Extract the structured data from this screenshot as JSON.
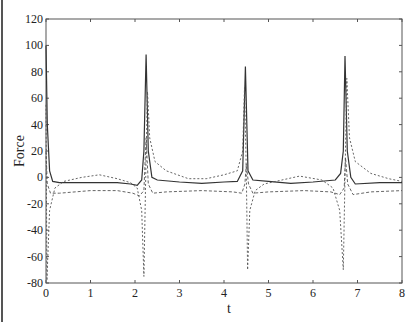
{
  "chart_data": {
    "type": "line",
    "title": "",
    "xlabel": "t",
    "ylabel": "Force",
    "xlim": [
      0,
      8
    ],
    "ylim": [
      -80,
      120
    ],
    "xticks": [
      0,
      1,
      2,
      3,
      4,
      5,
      6,
      7,
      8
    ],
    "yticks": [
      -80,
      -60,
      -40,
      -20,
      0,
      20,
      40,
      60,
      80,
      100,
      120
    ],
    "grid": false,
    "legend": null,
    "series": [
      {
        "name": "solid",
        "style": "solid",
        "points": [
          [
            0,
            100
          ],
          [
            0.03,
            40
          ],
          [
            0.08,
            5
          ],
          [
            0.15,
            -3
          ],
          [
            0.3,
            -4
          ],
          [
            1.0,
            -4
          ],
          [
            1.6,
            -4
          ],
          [
            1.9,
            -5
          ],
          [
            2.05,
            -6
          ],
          [
            2.15,
            -2
          ],
          [
            2.2,
            20
          ],
          [
            2.25,
            93
          ],
          [
            2.3,
            20
          ],
          [
            2.38,
            0
          ],
          [
            2.5,
            -2
          ],
          [
            3.0,
            -3.5
          ],
          [
            3.5,
            -4.5
          ],
          [
            4.0,
            -3.5
          ],
          [
            4.3,
            -3
          ],
          [
            4.42,
            5
          ],
          [
            4.48,
            84
          ],
          [
            4.54,
            5
          ],
          [
            4.65,
            -2
          ],
          [
            5.0,
            -3
          ],
          [
            5.5,
            -4.5
          ],
          [
            6.0,
            -3.5
          ],
          [
            6.5,
            -2
          ],
          [
            6.62,
            3
          ],
          [
            6.68,
            20
          ],
          [
            6.72,
            92
          ],
          [
            6.77,
            20
          ],
          [
            6.85,
            0
          ],
          [
            6.95,
            -5
          ],
          [
            7.5,
            -4
          ],
          [
            8.0,
            -4
          ]
        ]
      },
      {
        "name": "dash-dot",
        "style": "dashdot",
        "points": [
          [
            0,
            55
          ],
          [
            0.02,
            -78
          ],
          [
            0.08,
            -25
          ],
          [
            0.2,
            -8
          ],
          [
            0.4,
            -3
          ],
          [
            0.8,
            0
          ],
          [
            1.2,
            2
          ],
          [
            1.6,
            -1
          ],
          [
            1.9,
            -4
          ],
          [
            2.05,
            -8
          ],
          [
            2.15,
            -25
          ],
          [
            2.2,
            -75
          ],
          [
            2.24,
            0
          ],
          [
            2.28,
            65
          ],
          [
            2.33,
            30
          ],
          [
            2.45,
            12
          ],
          [
            2.7,
            5
          ],
          [
            3.2,
            -1
          ],
          [
            3.6,
            -1
          ],
          [
            4.0,
            2
          ],
          [
            4.3,
            5
          ],
          [
            4.42,
            20
          ],
          [
            4.46,
            68
          ],
          [
            4.5,
            5
          ],
          [
            4.53,
            -70
          ],
          [
            4.58,
            -25
          ],
          [
            4.7,
            -10
          ],
          [
            4.9,
            -5
          ],
          [
            5.3,
            -2
          ],
          [
            5.7,
            1
          ],
          [
            6.2,
            -2
          ],
          [
            6.45,
            -8
          ],
          [
            6.6,
            -25
          ],
          [
            6.68,
            -70
          ],
          [
            6.72,
            0
          ],
          [
            6.76,
            75
          ],
          [
            6.82,
            30
          ],
          [
            6.95,
            12
          ],
          [
            7.3,
            3
          ],
          [
            7.7,
            -1
          ],
          [
            8.0,
            -3
          ]
        ]
      },
      {
        "name": "dashed",
        "style": "dashed",
        "points": [
          [
            0,
            20
          ],
          [
            0.03,
            -5
          ],
          [
            0.1,
            -12
          ],
          [
            0.3,
            -12
          ],
          [
            1.0,
            -10
          ],
          [
            1.6,
            -10
          ],
          [
            1.95,
            -12
          ],
          [
            2.1,
            -14
          ],
          [
            2.2,
            -10
          ],
          [
            2.25,
            30
          ],
          [
            2.3,
            -5
          ],
          [
            2.4,
            -12
          ],
          [
            2.7,
            -11
          ],
          [
            3.5,
            -10
          ],
          [
            4.2,
            -11
          ],
          [
            4.4,
            -12
          ],
          [
            4.47,
            -5
          ],
          [
            4.5,
            10
          ],
          [
            4.55,
            -5
          ],
          [
            4.65,
            -12
          ],
          [
            5.0,
            -11
          ],
          [
            5.8,
            -10
          ],
          [
            6.4,
            -11
          ],
          [
            6.6,
            -13
          ],
          [
            6.7,
            -8
          ],
          [
            6.73,
            15
          ],
          [
            6.78,
            -5
          ],
          [
            6.9,
            -13
          ],
          [
            7.3,
            -11
          ],
          [
            8.0,
            -10
          ]
        ]
      }
    ]
  }
}
